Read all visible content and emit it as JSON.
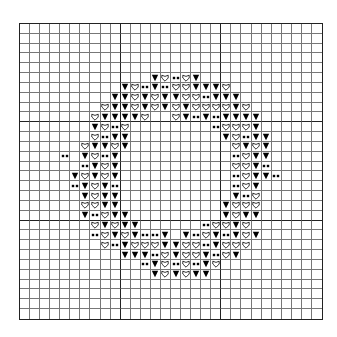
{
  "chart": {
    "columns": 30,
    "rows": 30,
    "heavy_line_every": 10,
    "grid_color": "#777777",
    "heavy_line_color": "#222222",
    "legend": {
      "T": {
        "name": "filled-triangle",
        "color": "#000000"
      },
      "H": {
        "name": "outline-heart",
        "color": "#000000"
      },
      "D": {
        "name": "double-dot",
        "color": "#000000"
      },
      ".": {
        "name": "empty"
      }
    },
    "pattern": [
      "..............................",
      "..............................",
      "..............................",
      "..............................",
      "..............................",
      ".............THDHT............",
      "..........THDTDHHTTTH.........",
      ".........TTHTHTTHHDTTT........",
      "........HTTHTHTHTHHHHTH.......",
      ".......HTTTTH..HTDTDTTTT......",
      ".......THDH........DHHHT......",
      ".......HDTT.........THDTT.....",
      "......HTTHT..........HTHT.....",
      "....D.THDT...........DHTT.....",
      "......DTHT...........HHTD.....",
      ".....THTHT...........DHTTD....",
      ".....DTHTD...........DHT......",
      "......THTT...........TDH......",
      "......HHTT..........THHH......",
      "......TDHTT.........THTT......",
      ".......HTHTT......DHHTH.......",
      ".......DHTHTDDT.TDHTDTHT......",
      "........HDTHHHTTHHDTHHH.......",
      "..........TTTDHTHHTDHT........",
      "............DTHDHDTH..........",
      ".............THTHTT...........",
      "..............................",
      "..............................",
      "..............................",
      ".............................."
    ]
  }
}
